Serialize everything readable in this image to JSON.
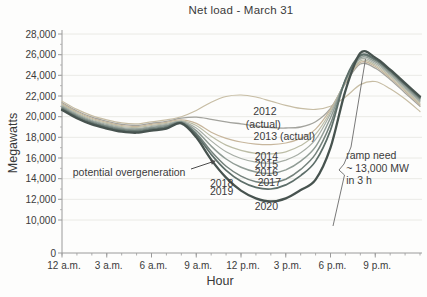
{
  "chart_data": {
    "type": "line",
    "title": "Net load - March 31",
    "xlabel": "Hour",
    "ylabel": "Megawatts",
    "grid": "horizontal",
    "axis_note": "y axis breaks between 0 and 10,000",
    "x_hours": [
      0,
      1,
      2,
      3,
      4,
      5,
      6,
      7,
      8,
      9,
      10,
      11,
      12,
      13,
      14,
      15,
      16,
      17,
      18,
      19,
      20,
      21,
      22,
      23,
      24
    ],
    "x_ticks": [
      {
        "label": "12 a.m.",
        "hour": 0
      },
      {
        "label": "3 a.m.",
        "hour": 3
      },
      {
        "label": "6 a.m.",
        "hour": 6
      },
      {
        "label": "9 a.m.",
        "hour": 9
      },
      {
        "label": "12 p.m.",
        "hour": 12
      },
      {
        "label": "3 p.m.",
        "hour": 15
      },
      {
        "label": "6 p.m.",
        "hour": 18
      },
      {
        "label": "9 p.m.",
        "hour": 21
      }
    ],
    "y_ticks": [
      {
        "label": "28,000",
        "mw": 28000
      },
      {
        "label": "26,000",
        "mw": 26000
      },
      {
        "label": "24,000",
        "mw": 24000
      },
      {
        "label": "22,000",
        "mw": 22000
      },
      {
        "label": "20,000",
        "mw": 20000
      },
      {
        "label": "18,000",
        "mw": 18000
      },
      {
        "label": "16,000",
        "mw": 16000
      },
      {
        "label": "14,000",
        "mw": 14000
      },
      {
        "label": "12,000",
        "mw": 12000
      },
      {
        "label": "10,000",
        "mw": 10000
      },
      {
        "label": "0",
        "mw": 0
      }
    ],
    "series": [
      {
        "name": "2012 (actual)",
        "color": "#c7bda4",
        "width": 1.2,
        "values": [
          21500,
          20700,
          20100,
          19700,
          19400,
          19300,
          19500,
          19700,
          20000,
          20600,
          21400,
          21950,
          22100,
          21900,
          21500,
          21100,
          20800,
          20700,
          21000,
          21900,
          23100,
          23400,
          22700,
          21700,
          20500
        ]
      },
      {
        "name": "2013 (actual)",
        "color": "#a3a39d",
        "width": 1.3,
        "values": [
          21350,
          20550,
          19950,
          19550,
          19250,
          19150,
          19350,
          19550,
          19850,
          19950,
          19750,
          19500,
          19300,
          19100,
          18950,
          18900,
          19000,
          19500,
          20800,
          23200,
          25100,
          24700,
          23600,
          22300,
          21000
        ]
      },
      {
        "name": "2014",
        "color": "#c7b69c",
        "width": 1.2,
        "values": [
          21250,
          20450,
          19850,
          19450,
          19150,
          19050,
          19250,
          19450,
          19700,
          19350,
          18500,
          17900,
          17550,
          17350,
          17300,
          17450,
          17900,
          18800,
          20700,
          23300,
          25250,
          24850,
          23750,
          22450,
          21150
        ]
      },
      {
        "name": "2015",
        "color": "#bcbda6",
        "width": 1.2,
        "values": [
          21150,
          20350,
          19750,
          19350,
          19050,
          18950,
          19150,
          19350,
          19600,
          19150,
          18100,
          17250,
          16750,
          16450,
          16400,
          16600,
          17200,
          18300,
          20500,
          23400,
          25400,
          25000,
          23900,
          22600,
          21300
        ]
      },
      {
        "name": "2016",
        "color": "#a7aea6",
        "width": 1.2,
        "values": [
          21050,
          20250,
          19650,
          19250,
          18950,
          18850,
          19050,
          19250,
          19550,
          18900,
          17650,
          16600,
          15950,
          15600,
          15500,
          15800,
          16500,
          17800,
          20300,
          23450,
          25550,
          25150,
          24050,
          22750,
          21450
        ]
      },
      {
        "name": "2017",
        "color": "#909c95",
        "width": 1.5,
        "values": [
          20950,
          20150,
          19550,
          19150,
          18850,
          18750,
          18950,
          19150,
          19500,
          18650,
          17150,
          15900,
          15100,
          14650,
          14500,
          14850,
          15700,
          17100,
          19900,
          23500,
          25700,
          25300,
          24200,
          22900,
          21600
        ]
      },
      {
        "name": "2018",
        "color": "#75837d",
        "width": 1.5,
        "values": [
          20850,
          20050,
          19450,
          19050,
          18750,
          18650,
          18850,
          19050,
          19450,
          18400,
          16650,
          15200,
          14250,
          13700,
          13600,
          13950,
          14900,
          16400,
          19300,
          23550,
          25850,
          25450,
          24350,
          23050,
          21750
        ]
      },
      {
        "name": "2019",
        "color": "#5d6e69",
        "width": 1.7,
        "values": [
          20750,
          19950,
          19350,
          18950,
          18650,
          18550,
          18750,
          18950,
          19400,
          18250,
          16350,
          14800,
          13750,
          13150,
          13000,
          13400,
          14300,
          15700,
          18700,
          23600,
          25950,
          25550,
          24450,
          23150,
          21850
        ]
      },
      {
        "name": "2020",
        "color": "#47534f",
        "width": 2.3,
        "values": [
          20650,
          19850,
          19250,
          18850,
          18550,
          18450,
          18650,
          18850,
          19350,
          18000,
          15850,
          14100,
          12850,
          12100,
          11800,
          12100,
          12900,
          13900,
          17000,
          22500,
          26150,
          25700,
          24550,
          23250,
          21950
        ]
      }
    ],
    "series_labels": [
      {
        "text": "2012",
        "hour": 13.6,
        "mw": 20500,
        "align": "middle"
      },
      {
        "text": "(actual)",
        "hour": 13.5,
        "mw": 19250,
        "align": "middle"
      },
      {
        "text": "2013 (actual)",
        "hour": 14.9,
        "mw": 18100,
        "align": "middle"
      },
      {
        "text": "2014",
        "hour": 13.7,
        "mw": 16150,
        "align": "middle"
      },
      {
        "text": "2015",
        "hour": 13.7,
        "mw": 15380,
        "align": "middle"
      },
      {
        "text": "2016",
        "hour": 13.7,
        "mw": 14600,
        "align": "middle"
      },
      {
        "text": "2017",
        "hour": 13.9,
        "mw": 13630,
        "align": "middle"
      },
      {
        "text": "2018",
        "hour": 10.7,
        "mw": 13530,
        "align": "middle"
      },
      {
        "text": "2019",
        "hour": 10.7,
        "mw": 12760,
        "align": "middle"
      },
      {
        "text": "2020",
        "hour": 13.7,
        "mw": 11300,
        "align": "middle"
      }
    ],
    "annotations": {
      "overgeneration": {
        "text": "potential overgeneration",
        "hour": 4.5,
        "mw": 14550,
        "arrow_px": [
          [
            191,
            169
          ],
          [
            212,
            162
          ]
        ]
      },
      "ramp": {
        "lines": [
          "ramp need",
          "~ 13,000 MW",
          "in 3 h"
        ],
        "hour": 19.05,
        "mw": 16200,
        "line_height": 12.5,
        "pointer_px": [
          [
            333,
            226
          ],
          [
            344.5,
            175
          ],
          [
            339,
            170
          ],
          [
            344,
            164
          ],
          [
            351,
            147
          ],
          [
            365.5,
            59
          ]
        ]
      }
    }
  }
}
